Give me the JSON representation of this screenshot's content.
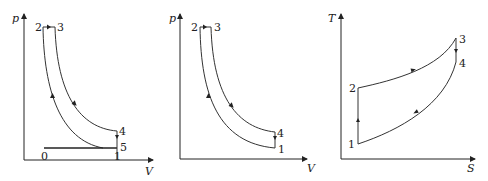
{
  "diagrams": [
    {
      "id": "pv-otto-with-intake",
      "x_axis": "V",
      "y_axis": "p",
      "points": {
        "p0": "0",
        "p1": "1",
        "p2": "2",
        "p3": "3",
        "p4": "4",
        "p5": "5"
      }
    },
    {
      "id": "pv-otto-cycle",
      "x_axis": "V",
      "y_axis": "p",
      "points": {
        "p1": "1",
        "p2": "2",
        "p3": "3",
        "p4": "4"
      }
    },
    {
      "id": "ts-cycle",
      "x_axis": "S",
      "y_axis": "T",
      "points": {
        "p1": "1",
        "p2": "2",
        "p3": "3",
        "p4": "4"
      }
    }
  ],
  "colors": {
    "line": "#222222",
    "background": "#ffffff"
  }
}
